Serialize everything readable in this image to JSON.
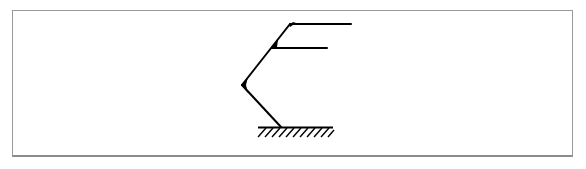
{
  "diagram": {
    "type": "structural-frame-sketch",
    "colors": {
      "stroke": "#000000",
      "frame_border": "#9a9a9a",
      "background": "#ffffff"
    },
    "ground": {
      "x1": 258,
      "x2": 333,
      "y": 127,
      "hatch_count": 11,
      "hatch_depth": 10
    },
    "members": [
      {
        "name": "lower-leg",
        "from": [
          281,
          127
        ],
        "to": [
          242,
          85
        ]
      },
      {
        "name": "upper-leg",
        "from": [
          242,
          85
        ],
        "to": [
          290,
          24
        ]
      },
      {
        "name": "middle-arm",
        "from": [
          272,
          48
        ],
        "to": [
          327,
          48
        ]
      },
      {
        "name": "top-arm",
        "from": [
          290,
          24
        ],
        "to": [
          351,
          24
        ]
      }
    ],
    "joints": [
      {
        "name": "knee-joint",
        "at": [
          242,
          85
        ]
      },
      {
        "name": "middle-joint",
        "at": [
          272,
          48
        ]
      },
      {
        "name": "top-joint",
        "at": [
          290,
          24
        ]
      }
    ]
  }
}
